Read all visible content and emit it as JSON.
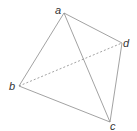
{
  "figure": {
    "type": "tetrahedron",
    "vertices": {
      "a": {
        "label": "a",
        "x": 64,
        "y": 13,
        "lx": 55,
        "ly": 14
      },
      "b": {
        "label": "b",
        "x": 19,
        "y": 86,
        "lx": 9,
        "ly": 90
      },
      "c": {
        "label": "c",
        "x": 110,
        "y": 122,
        "lx": 110,
        "ly": 131
      },
      "d": {
        "label": "d",
        "x": 122,
        "y": 43,
        "lx": 123,
        "ly": 47
      }
    },
    "edges": [
      {
        "from": "a",
        "to": "b",
        "style": "solid"
      },
      {
        "from": "a",
        "to": "c",
        "style": "solid"
      },
      {
        "from": "a",
        "to": "d",
        "style": "solid"
      },
      {
        "from": "b",
        "to": "c",
        "style": "solid"
      },
      {
        "from": "c",
        "to": "d",
        "style": "solid"
      },
      {
        "from": "b",
        "to": "d",
        "style": "dashed"
      }
    ],
    "colors": {
      "line": "#8a8a8a",
      "label": "#333333"
    }
  }
}
